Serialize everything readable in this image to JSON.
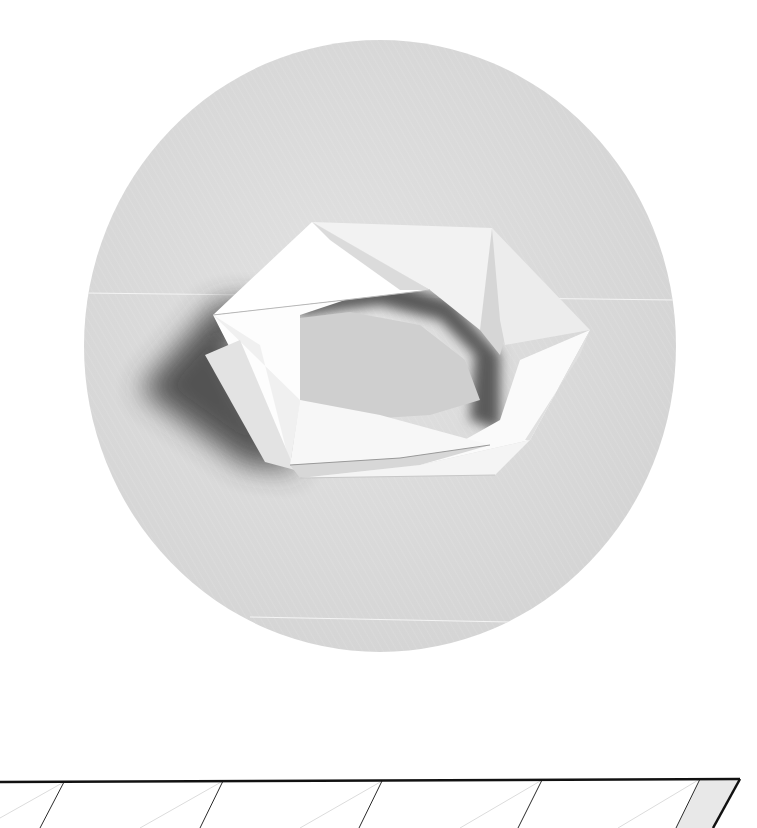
{
  "figure": {
    "colors": {
      "page_background": "#ffffff",
      "disc_light": "#e4e4e4",
      "disc_dark": "#cfcfcf",
      "paper_white": "#ffffff",
      "paper_shade": "#d9d9d9",
      "shadow": "#4a4a4a",
      "crease_line": "#1a1a1a",
      "faint_line": "#d8d8d8",
      "end_fill": "#e6e6e6"
    },
    "disc": {
      "cx": 380,
      "cy": 346,
      "rx": 296,
      "ry": 306
    }
  },
  "crease_strip": {
    "top_edge": {
      "x1": 0,
      "y1": 22,
      "x2": 740,
      "y2": 19
    },
    "mountain_folds": [
      {
        "x_top": 64,
        "x_bottom": 40
      },
      {
        "x_top": 223,
        "x_bottom": 200
      },
      {
        "x_top": 382,
        "x_bottom": 359
      },
      {
        "x_top": 542,
        "x_bottom": 518
      },
      {
        "x_top": 700,
        "x_bottom": 676
      }
    ],
    "end_edge": {
      "x_top": 740,
      "x_bottom": 713
    },
    "valley_folds_count": 5
  }
}
